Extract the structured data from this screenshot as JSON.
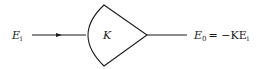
{
  "diagram": {
    "type": "amplifier-block",
    "input": {
      "symbol": "E",
      "subscript": "i"
    },
    "block": {
      "label": "K",
      "shape": "amplifier"
    },
    "output": {
      "symbol": "E",
      "subscript": "0",
      "equation_rhs": "= −KE",
      "rhs_subscript": "i"
    },
    "stroke_color": "#1a1a1a"
  }
}
